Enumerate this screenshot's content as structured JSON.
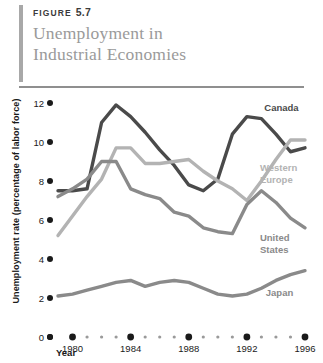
{
  "header": {
    "figure_label": "FIGURE",
    "figure_number": "5.7",
    "title_line1": "Unemployment in",
    "title_line2": "Industrial Economies",
    "accent_color": "#a8a8a8",
    "title_color": "#9a9a9a"
  },
  "chart_data": {
    "type": "line",
    "title": "Unemployment in Industrial Economies",
    "xlabel": "Year",
    "ylabel": "Unemployment rate (percentage of labor force)",
    "xlim": [
      1979,
      1996
    ],
    "ylim": [
      0,
      12
    ],
    "ytick_labels": [
      "0",
      "2",
      "4",
      "6",
      "8",
      "10",
      "12"
    ],
    "ytick_values": [
      0,
      2,
      4,
      6,
      8,
      10,
      12
    ],
    "xtick_labels": [
      "1980",
      "1984",
      "1988",
      "1992",
      "1996"
    ],
    "xtick_values": [
      1980,
      1984,
      1988,
      1992,
      1996
    ],
    "minor_xticks": [
      1981,
      1982,
      1983,
      1985,
      1986,
      1987,
      1989,
      1990,
      1991,
      1993,
      1994,
      1995
    ],
    "grid": false,
    "legend": "inline-labels",
    "x": [
      1979,
      1980,
      1981,
      1982,
      1983,
      1984,
      1985,
      1986,
      1987,
      1988,
      1989,
      1990,
      1991,
      1992,
      1993,
      1994,
      1995,
      1996
    ],
    "series": [
      {
        "name": "Canada",
        "color": "#4a4a4a",
        "label_x": 1993.2,
        "label_y": 11.6,
        "values": [
          7.5,
          7.5,
          7.6,
          11.0,
          11.9,
          11.3,
          10.5,
          9.6,
          8.8,
          7.8,
          7.5,
          8.1,
          10.4,
          11.3,
          11.2,
          10.4,
          9.5,
          9.7
        ]
      },
      {
        "name": "Western Europe",
        "color": "#b3b3b3",
        "label_x": 1992.9,
        "label_y": 8.5,
        "label_line2": "Europe",
        "values": [
          5.2,
          6.2,
          7.2,
          8.1,
          9.7,
          9.7,
          8.9,
          8.9,
          9.0,
          9.1,
          8.5,
          8.0,
          7.6,
          7.0,
          8.0,
          9.1,
          10.1,
          10.1
        ]
      },
      {
        "name": "United States",
        "color": "#8a8a8a",
        "label_x": 1992.9,
        "label_y": 4.9,
        "label_line2": "States",
        "values": [
          7.2,
          7.6,
          8.1,
          9.0,
          9.0,
          7.6,
          7.3,
          7.1,
          6.4,
          6.2,
          5.6,
          5.4,
          5.3,
          6.8,
          7.5,
          6.9,
          6.1,
          5.6
        ]
      },
      {
        "name": "Japan",
        "color": "#8a8a8a",
        "label_x": 1993.3,
        "label_y": 2.1,
        "values": [
          2.1,
          2.2,
          2.4,
          2.6,
          2.8,
          2.9,
          2.6,
          2.8,
          2.9,
          2.8,
          2.5,
          2.2,
          2.1,
          2.2,
          2.5,
          2.9,
          3.2,
          3.4
        ]
      }
    ]
  }
}
